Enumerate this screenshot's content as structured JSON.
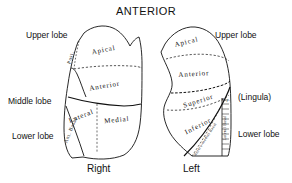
{
  "figure": {
    "title": "ANTERIOR",
    "right_side_name": "Right",
    "left_side_name": "Left"
  },
  "outer_labels": {
    "right_upper_lobe": "Upper lobe",
    "right_middle_lobe": "Middle lobe",
    "right_lower_lobe": "Lower lobe",
    "left_upper_lobe": "Upper lobe",
    "left_lingula": "(Lingula)",
    "left_lower_lobe": "Lower lobe"
  },
  "right_lung": {
    "segments": [
      {
        "name": "Apical",
        "lobe": "upper"
      },
      {
        "name": "Posterior",
        "short": "Post.",
        "lobe": "upper"
      },
      {
        "name": "Anterior",
        "lobe": "upper"
      },
      {
        "name": "Lateral",
        "lobe": "middle"
      },
      {
        "name": "Medial",
        "lobe": "middle"
      },
      {
        "name": "Ant. Basal",
        "lobe": "lower"
      }
    ]
  },
  "left_lung": {
    "segments": [
      {
        "name": "Apical",
        "lobe": "upper"
      },
      {
        "name": "Anterior",
        "lobe": "upper"
      },
      {
        "name": "Superior",
        "lobe": "lingula"
      },
      {
        "name": "Inferior",
        "lobe": "lingula"
      },
      {
        "name": "Superior",
        "short": "Sup.",
        "lobe": "lower"
      },
      {
        "name": "Antero-medial Basal",
        "lobe": "lower"
      },
      {
        "name": "Lateral Basal",
        "lobe": "lower"
      }
    ]
  },
  "style": {
    "line_color": "#111111",
    "background": "#ffffff"
  }
}
